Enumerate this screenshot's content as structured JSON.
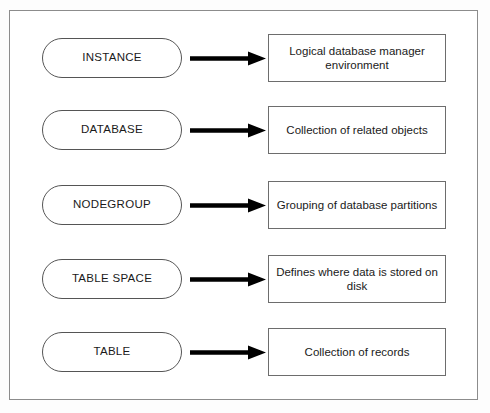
{
  "diagram": {
    "frame": {
      "border_color": "#8c8c8c"
    },
    "arrow_icon_name": "right-arrow-icon",
    "arrow_color": "#000000",
    "rows": [
      {
        "term": "INSTANCE",
        "description": "Logical database manager environment"
      },
      {
        "term": "DATABASE",
        "description": "Collection of related objects"
      },
      {
        "term": "NODEGROUP",
        "description": "Grouping of database partitions"
      },
      {
        "term": "TABLE SPACE",
        "description": "Defines where data is stored on disk"
      },
      {
        "term": "TABLE",
        "description": "Collection of records"
      }
    ]
  }
}
